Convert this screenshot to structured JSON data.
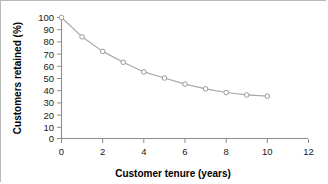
{
  "chart_data": {
    "type": "line",
    "title": "",
    "subtitle": "",
    "xlabel": "Customer tenure (years)",
    "ylabel": "Customers retained (%)",
    "xlim": [
      0,
      12
    ],
    "ylim": [
      0,
      100
    ],
    "xticks": [
      0,
      2,
      4,
      6,
      8,
      10,
      12
    ],
    "xtick_labels": [
      "0",
      "2",
      "4",
      "6",
      "8",
      "10",
      "12"
    ],
    "yticks": [
      0,
      10,
      20,
      30,
      40,
      50,
      60,
      70,
      80,
      90,
      100
    ],
    "ytick_labels": [
      "0",
      "10",
      "20",
      "30",
      "40",
      "50",
      "60",
      "70",
      "80",
      "90",
      "100"
    ],
    "x": [
      0,
      1,
      2,
      3,
      4,
      5,
      6,
      7,
      8,
      9,
      10
    ],
    "values": [
      100,
      84,
      72,
      63,
      55,
      50,
      45,
      41,
      38,
      36,
      35
    ],
    "series": [
      {
        "name": "Customers retained",
        "values": [
          100,
          84,
          72,
          63,
          55,
          50,
          45,
          41,
          38,
          36,
          35
        ]
      }
    ],
    "grid": false,
    "legend": false,
    "legend_position": "none",
    "marker": "open-circle",
    "colors": {
      "line": "#a8a8a8",
      "marker_fill": "#ffffff",
      "marker_stroke": "#9a9a9a",
      "axis": "#8c8c8c",
      "text": "#1a1a1a",
      "frame": "#b9b9b9",
      "background": "#ffffff"
    }
  }
}
